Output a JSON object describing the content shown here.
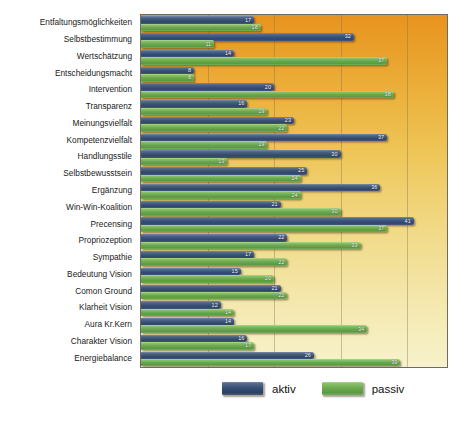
{
  "chart_data": {
    "type": "bar",
    "orientation": "horizontal",
    "title": "",
    "xlabel": "",
    "ylabel": "",
    "xlim": [
      0,
      46
    ],
    "grid": true,
    "gridlines": [
      10,
      20,
      30,
      40
    ],
    "legend_position": "bottom",
    "categories": [
      "Entfaltungsmöglichkeiten",
      "Selbstbestimmung",
      "Wertschätzung",
      "Entscheidungsmacht",
      "Intervention",
      "Transparenz",
      "Meinungsvielfalt",
      "Kompetenzvielfalt",
      "Handlungsstile",
      "Selbstbewusstsein",
      "Ergänzung",
      "Win-Win-Koalition",
      "Precensing",
      "Propriozeption",
      "Sympathie",
      "Bedeutung Vision",
      "Comon Ground",
      "Klarheit Vision",
      "Aura Kr.Kern",
      "Charakter Vision",
      "Energiebalance"
    ],
    "series": [
      {
        "name": "aktiv",
        "color": "#2f4668",
        "values": [
          17,
          32,
          14,
          8,
          20,
          16,
          23,
          37,
          30,
          25,
          36,
          21,
          41,
          22,
          17,
          15,
          21,
          12,
          14,
          16,
          26
        ]
      },
      {
        "name": "passiv",
        "color": "#6aa84f",
        "values": [
          18,
          11,
          37,
          8,
          38,
          19,
          22,
          19,
          13,
          24,
          24,
          30,
          37,
          33,
          22,
          20,
          22,
          14,
          34,
          17,
          39
        ]
      }
    ]
  },
  "legend": {
    "items": [
      {
        "label": "aktiv",
        "color": "#2f4668"
      },
      {
        "label": "passiv",
        "color": "#6aa84f"
      }
    ]
  }
}
